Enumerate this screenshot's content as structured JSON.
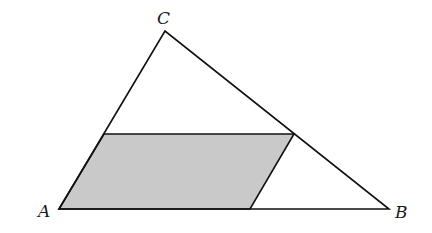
{
  "diagram": {
    "type": "geometry-triangle-with-inscribed-parallelogram",
    "colors": {
      "stroke": "#111111",
      "shade": "#c9c9c9",
      "background": "#ffffff"
    },
    "triangle": {
      "vertices": {
        "A": {
          "label": "A",
          "x": 59,
          "y": 209,
          "label_x": 38,
          "label_y": 217
        },
        "B": {
          "label": "B",
          "x": 389,
          "y": 209,
          "label_x": 395,
          "label_y": 218
        },
        "C": {
          "label": "C",
          "x": 165,
          "y": 31,
          "label_x": 157,
          "label_y": 24
        }
      }
    },
    "parallelogram": {
      "shaded": true,
      "points": [
        {
          "x": 59,
          "y": 209
        },
        {
          "x": 104,
          "y": 134
        },
        {
          "x": 294,
          "y": 134
        },
        {
          "x": 250,
          "y": 209
        }
      ]
    }
  }
}
